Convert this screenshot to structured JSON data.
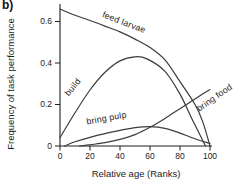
{
  "figure": {
    "panel_label": "b)",
    "colors": {
      "curve": "#3c3c3c",
      "axis": "#1e1e1e",
      "text": "#1c1c1c",
      "background": "#ffffff"
    }
  },
  "chart_data": {
    "type": "line",
    "title": "",
    "xlabel": "Relative age (Ranks)",
    "ylabel": "Frequency of task performance",
    "xlim": [
      0,
      105
    ],
    "ylim": [
      0,
      0.7
    ],
    "grid": false,
    "legend_position": "inline-curve-labels",
    "x_ticks": [
      0,
      20,
      40,
      60,
      80,
      100
    ],
    "x_tick_labels": [
      "0",
      "20",
      "40",
      "60",
      "80",
      "100"
    ],
    "y_ticks": [
      0,
      0.2,
      0.4,
      0.6
    ],
    "y_tick_labels": [
      "0",
      "0.2",
      "0.4",
      "0.6"
    ],
    "series": [
      {
        "name": "feed larvae",
        "x": [
          0,
          10,
          20,
          30,
          40,
          50,
          60,
          70,
          80,
          90,
          95,
          100
        ],
        "y": [
          0.66,
          0.63,
          0.605,
          0.578,
          0.55,
          0.515,
          0.475,
          0.415,
          0.31,
          0.2,
          0.12,
          0
        ]
      },
      {
        "name": "build",
        "x": [
          0,
          10,
          20,
          30,
          40,
          50,
          58,
          70,
          80,
          88,
          97
        ],
        "y": [
          0.04,
          0.16,
          0.27,
          0.355,
          0.41,
          0.43,
          0.42,
          0.36,
          0.25,
          0.13,
          0
        ]
      },
      {
        "name": "bring pulp",
        "x": [
          3,
          10,
          20,
          30,
          40,
          50,
          60,
          70,
          80,
          90,
          100
        ],
        "y": [
          0,
          0.02,
          0.042,
          0.06,
          0.075,
          0.088,
          0.093,
          0.085,
          0.062,
          0.035,
          0.012
        ]
      },
      {
        "name": "bring food",
        "x": [
          13,
          20,
          30,
          40,
          50,
          60,
          70,
          80,
          90,
          100
        ],
        "y": [
          0,
          0.006,
          0.016,
          0.032,
          0.055,
          0.09,
          0.133,
          0.18,
          0.227,
          0.272
        ]
      }
    ]
  }
}
